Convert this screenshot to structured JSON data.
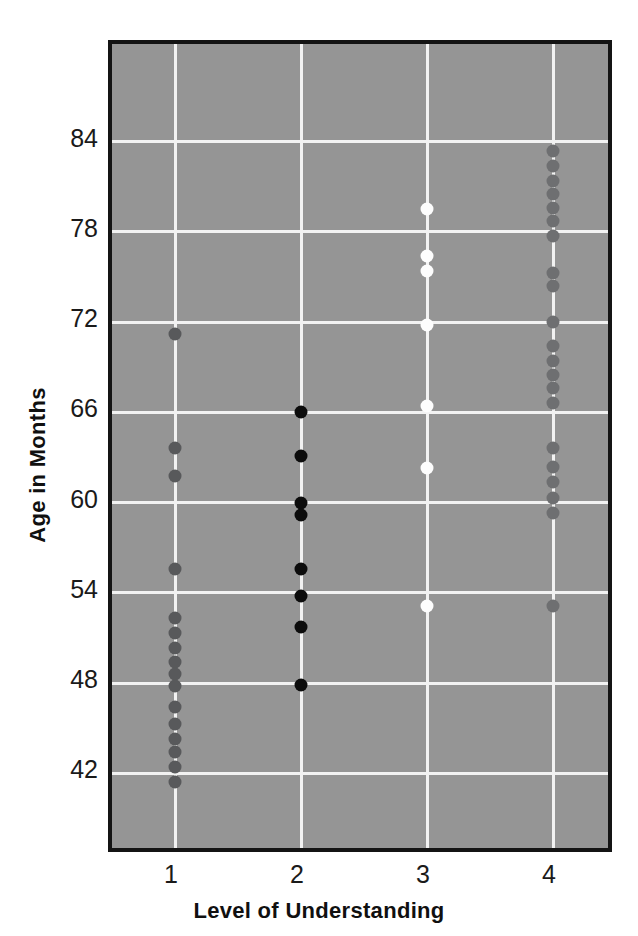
{
  "chart_data": {
    "type": "scatter",
    "title": "",
    "xlabel": "Level of Understanding",
    "ylabel": "Age in Months",
    "xlim": [
      0.5,
      4.5
    ],
    "ylim": [
      36.5,
      90.5
    ],
    "xticks": [
      "1",
      "2",
      "3",
      "4"
    ],
    "yticks": [
      "84",
      "78",
      "72",
      "66",
      "60",
      "54",
      "48",
      "42"
    ],
    "ytick_values": [
      84,
      78,
      72,
      66,
      60,
      54,
      48,
      42
    ],
    "xtick_values": [
      1,
      2,
      3,
      4
    ],
    "grid": true,
    "grid_color": "#f2f2f2",
    "plot_background": "#959595",
    "frame_color": "#141414",
    "legend": null,
    "series": [
      {
        "name": "Level 1",
        "x": 1,
        "marker_color": "#58595b",
        "values": [
          71.2,
          63.6,
          61.8,
          55.6,
          52.3,
          51.3,
          50.3,
          49.4,
          48.6,
          47.8,
          46.4,
          45.3,
          44.3,
          43.4,
          42.4,
          41.4
        ]
      },
      {
        "name": "Level 2",
        "x": 2,
        "marker_color": "#0c0c0c",
        "values": [
          66.0,
          63.1,
          60.0,
          59.2,
          55.6,
          53.8,
          51.7,
          47.9
        ]
      },
      {
        "name": "Level 3",
        "x": 3,
        "marker_color": "#fdfdfd",
        "values": [
          79.5,
          76.4,
          75.4,
          71.8,
          66.4,
          62.3,
          53.1
        ]
      },
      {
        "name": "Level 4",
        "x": 4,
        "marker_color": "#6e6f71",
        "values": [
          83.4,
          82.4,
          81.4,
          80.5,
          79.6,
          78.7,
          77.7,
          75.3,
          74.4,
          72.0,
          70.4,
          69.4,
          68.5,
          67.6,
          66.6,
          63.6,
          62.4,
          61.4,
          60.3,
          59.3,
          53.1
        ]
      }
    ]
  }
}
